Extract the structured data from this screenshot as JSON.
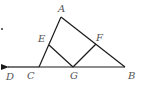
{
  "diagram": {
    "type": "geometry",
    "points": {
      "A": {
        "label": "A",
        "x": 61,
        "y": 17,
        "lx": 58,
        "ly": 12
      },
      "B": {
        "label": "B",
        "x": 125,
        "y": 67,
        "lx": 128,
        "ly": 79
      },
      "C": {
        "label": "C",
        "x": 39,
        "y": 67,
        "lx": 27,
        "ly": 79
      },
      "D": {
        "label": "D",
        "x": 7,
        "y": 67,
        "lx": 6,
        "ly": 80
      },
      "E": {
        "label": "E",
        "x": 49,
        "y": 45,
        "lx": 38,
        "ly": 42
      },
      "F": {
        "label": "F",
        "x": 96,
        "y": 44,
        "lx": 96,
        "ly": 41
      },
      "G": {
        "label": "G",
        "x": 73,
        "y": 67,
        "lx": 70,
        "ly": 79
      }
    },
    "segments": [
      [
        "A",
        "C"
      ],
      [
        "A",
        "B"
      ],
      [
        "C",
        "B"
      ],
      [
        "E",
        "G"
      ],
      [
        "F",
        "G"
      ]
    ],
    "ray": {
      "from": "C",
      "to": "D",
      "arrow": true
    },
    "stray_dot": {
      "x": 2,
      "y": 29
    },
    "colors": {
      "line": "#1a1a1a",
      "label": "#555555",
      "background": "#ffffff"
    }
  }
}
